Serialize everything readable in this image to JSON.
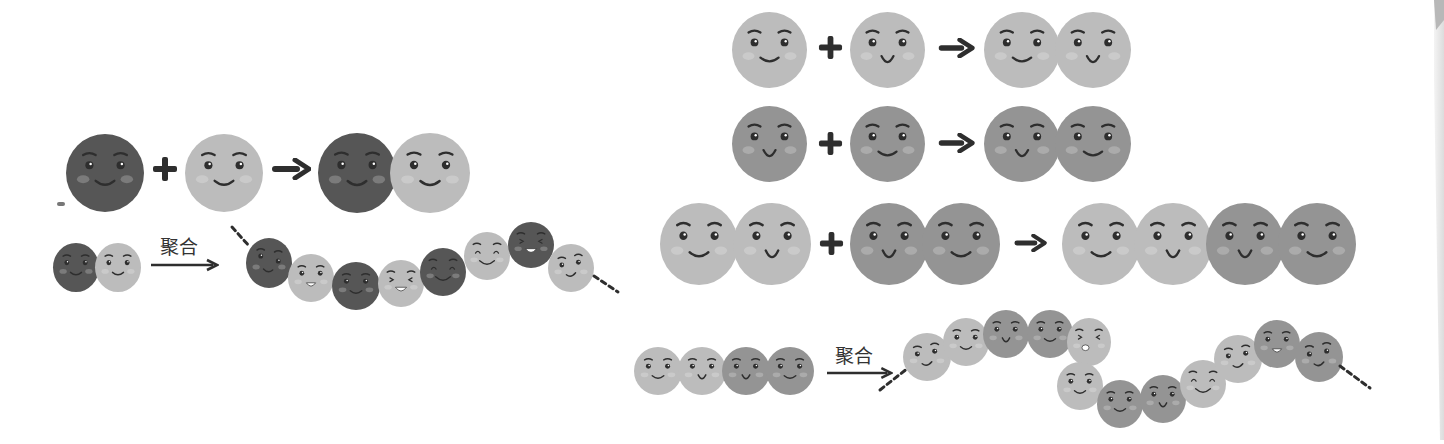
{
  "colors": {
    "dark": "#565656",
    "light": "#bcbcbc",
    "medium": "#949494",
    "ink": "#2e2e2e",
    "blush": "#cfcfcf"
  },
  "left_panel": {
    "equation": {
      "reactants": [
        "dark",
        "light"
      ],
      "operator": "+",
      "arrow": "→",
      "product": [
        "dark",
        "light"
      ]
    },
    "polymerization": {
      "monomer": [
        "dark",
        "light"
      ],
      "arrow_label": "聚合",
      "chain": [
        "dark",
        "light",
        "dark",
        "light",
        "dark",
        "light",
        "dark",
        "light"
      ],
      "chain_ends": "dashed"
    }
  },
  "right_panel": {
    "equations": [
      {
        "reactants": [
          "light",
          "light"
        ],
        "operator": "+",
        "arrow": "→",
        "product": [
          "light",
          "light"
        ]
      },
      {
        "reactants": [
          "medium",
          "medium"
        ],
        "operator": "+",
        "arrow": "→",
        "product": [
          "medium",
          "medium"
        ]
      },
      {
        "reactants": [
          "light-light dimer",
          "medium-medium dimer"
        ],
        "operator": "+",
        "arrow": "→",
        "product": [
          "light",
          "light",
          "medium",
          "medium"
        ]
      }
    ],
    "polymerization": {
      "monomer": [
        "light",
        "light",
        "medium",
        "medium"
      ],
      "arrow_label": "聚合",
      "chain": [
        "light",
        "light",
        "medium",
        "medium",
        "light",
        "light",
        "medium",
        "medium",
        "light",
        "light",
        "medium",
        "medium"
      ],
      "chain_ends": "dashed"
    }
  }
}
